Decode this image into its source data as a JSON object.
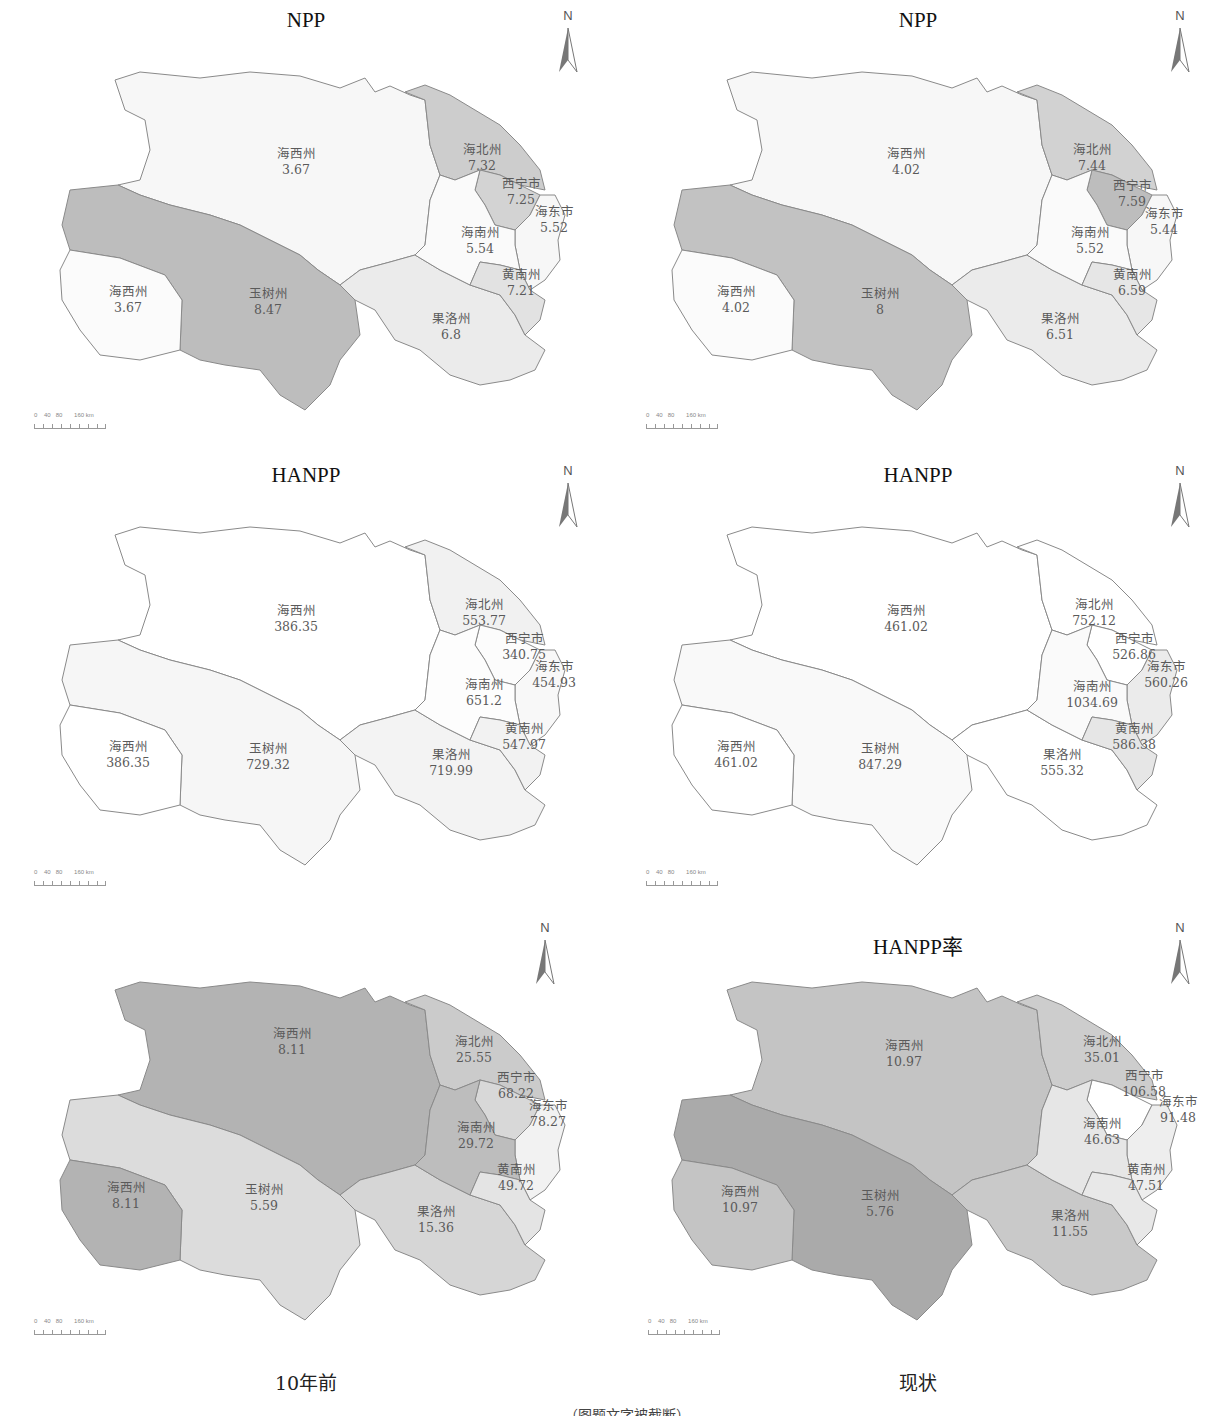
{
  "figure": {
    "column_captions": [
      "10年前",
      "现状"
    ],
    "caption_partial": "……（图题文字被截断）"
  },
  "colors": {
    "level_1": "#ffffff",
    "level_2": "#f4f4f4",
    "level_3": "#e6e6e6",
    "level_4": "#cfcfcf",
    "level_5": "#b9b9b9",
    "border": "#8a8a8a"
  },
  "north_arrow": {
    "label": "N"
  },
  "scale_bar": {
    "ticks": [
      "0",
      "40",
      "80",
      "160 km"
    ]
  },
  "panels": [
    {
      "id": "npp-10yr",
      "title": "NPP",
      "column": "10年前",
      "regions": {
        "haixi_n": {
          "name": "海西州",
          "value": "3.67"
        },
        "haixi_w": {
          "name": "海西州",
          "value": "3.67"
        },
        "yushu": {
          "name": "玉树州",
          "value": "8.47"
        },
        "guoluo": {
          "name": "果洛州",
          "value": "6.8"
        },
        "haibei": {
          "name": "海北州",
          "value": "7.32"
        },
        "xining": {
          "name": "西宁市",
          "value": "7.25"
        },
        "haidong": {
          "name": "海东市",
          "value": "5.52"
        },
        "hainan": {
          "name": "海南州",
          "value": "5.54"
        },
        "huangnan": {
          "name": "黄南州",
          "value": "7.21"
        }
      }
    },
    {
      "id": "npp-now",
      "title": "NPP",
      "column": "现状",
      "regions": {
        "haixi_n": {
          "name": "海西州",
          "value": "4.02"
        },
        "haixi_w": {
          "name": "海西州",
          "value": "4.02"
        },
        "yushu": {
          "name": "玉树州",
          "value": "8"
        },
        "guoluo": {
          "name": "果洛州",
          "value": "6.51"
        },
        "haibei": {
          "name": "海北州",
          "value": "7.44"
        },
        "xining": {
          "name": "西宁市",
          "value": "7.59"
        },
        "haidong": {
          "name": "海东市",
          "value": "5.44"
        },
        "hainan": {
          "name": "海南州",
          "value": "5.52"
        },
        "huangnan": {
          "name": "黄南州",
          "value": "6.59"
        }
      }
    },
    {
      "id": "hanpp-10yr",
      "title": "HANPP",
      "column": "10年前",
      "regions": {
        "haixi_n": {
          "name": "海西州",
          "value": "386.35"
        },
        "haixi_w": {
          "name": "海西州",
          "value": "386.35"
        },
        "yushu": {
          "name": "玉树州",
          "value": "729.32"
        },
        "guoluo": {
          "name": "果洛州",
          "value": "719.99"
        },
        "haibei": {
          "name": "海北州",
          "value": "553.77"
        },
        "xining": {
          "name": "西宁市",
          "value": "340.75"
        },
        "haidong": {
          "name": "海东市",
          "value": "454.93"
        },
        "hainan": {
          "name": "海南州",
          "value": "651.2"
        },
        "huangnan": {
          "name": "黄南州",
          "value": "547.97"
        }
      }
    },
    {
      "id": "hanpp-now",
      "title": "HANPP",
      "column": "现状",
      "regions": {
        "haixi_n": {
          "name": "海西州",
          "value": "461.02"
        },
        "haixi_w": {
          "name": "海西州",
          "value": "461.02"
        },
        "yushu": {
          "name": "玉树州",
          "value": "847.29"
        },
        "guoluo": {
          "name": "果洛州",
          "value": "555.32"
        },
        "haibei": {
          "name": "海北州",
          "value": "752.12"
        },
        "xining": {
          "name": "西宁市",
          "value": "526.86"
        },
        "haidong": {
          "name": "海东市",
          "value": "560.26"
        },
        "hainan": {
          "name": "海南州",
          "value": "1034.69"
        },
        "huangnan": {
          "name": "黄南州",
          "value": "586.38"
        }
      }
    },
    {
      "id": "rate-10yr",
      "title": "",
      "column": "10年前",
      "regions": {
        "haixi_n": {
          "name": "海西州",
          "value": "8.11"
        },
        "haixi_w": {
          "name": "海西州",
          "value": "8.11"
        },
        "yushu": {
          "name": "玉树州",
          "value": "5.59"
        },
        "guoluo": {
          "name": "果洛州",
          "value": "15.36"
        },
        "haibei": {
          "name": "海北州",
          "value": "25.55"
        },
        "xining": {
          "name": "西宁市",
          "value": "68.22"
        },
        "haidong": {
          "name": "海东市",
          "value": "78.27"
        },
        "hainan": {
          "name": "海南州",
          "value": "29.72"
        },
        "huangnan": {
          "name": "黄南州",
          "value": "49.72"
        }
      }
    },
    {
      "id": "rate-now",
      "title": "HANPP率",
      "column": "现状",
      "regions": {
        "haixi_n": {
          "name": "海西州",
          "value": "10.97"
        },
        "haixi_w": {
          "name": "海西州",
          "value": "10.97"
        },
        "yushu": {
          "name": "玉树州",
          "value": "5.76"
        },
        "guoluo": {
          "name": "果洛州",
          "value": "11.55"
        },
        "haibei": {
          "name": "海北州",
          "value": "35.01"
        },
        "xining": {
          "name": "西宁市",
          "value": "106.58"
        },
        "haidong": {
          "name": "海东市",
          "value": "91.48"
        },
        "hainan": {
          "name": "海南州",
          "value": "46.63"
        },
        "huangnan": {
          "name": "黄南州",
          "value": "47.51"
        }
      }
    }
  ]
}
